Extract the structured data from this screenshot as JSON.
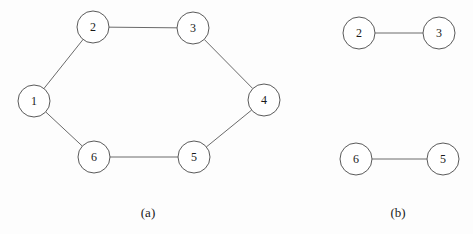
{
  "figure": {
    "node_radius": 16,
    "panels": [
      {
        "id": "a",
        "caption": "(a)",
        "caption_pos": [
          148,
          212
        ],
        "nodes": [
          {
            "id": "1",
            "label": "1",
            "x": 34,
            "y": 101
          },
          {
            "id": "2",
            "label": "2",
            "x": 93,
            "y": 27
          },
          {
            "id": "3",
            "label": "3",
            "x": 193,
            "y": 28
          },
          {
            "id": "4",
            "label": "4",
            "x": 264,
            "y": 100
          },
          {
            "id": "5",
            "label": "5",
            "x": 194,
            "y": 157
          },
          {
            "id": "6",
            "label": "6",
            "x": 94,
            "y": 157
          }
        ],
        "edges": [
          [
            "1",
            "2"
          ],
          [
            "2",
            "3"
          ],
          [
            "3",
            "4"
          ],
          [
            "4",
            "5"
          ],
          [
            "5",
            "6"
          ],
          [
            "6",
            "1"
          ]
        ]
      },
      {
        "id": "b",
        "caption": "(b)",
        "caption_pos": [
          398,
          212
        ],
        "nodes": [
          {
            "id": "2",
            "label": "2",
            "x": 359,
            "y": 33
          },
          {
            "id": "3",
            "label": "3",
            "x": 439,
            "y": 33
          },
          {
            "id": "6",
            "label": "6",
            "x": 356,
            "y": 159
          },
          {
            "id": "5",
            "label": "5",
            "x": 443,
            "y": 159
          }
        ],
        "edges": [
          [
            "2",
            "3"
          ],
          [
            "6",
            "5"
          ]
        ]
      }
    ]
  },
  "colors": {
    "edge": "#6a6a6a",
    "node_stroke": "#5a5a5a",
    "text": "#1a1a1a",
    "background": "#fdfdfd"
  }
}
